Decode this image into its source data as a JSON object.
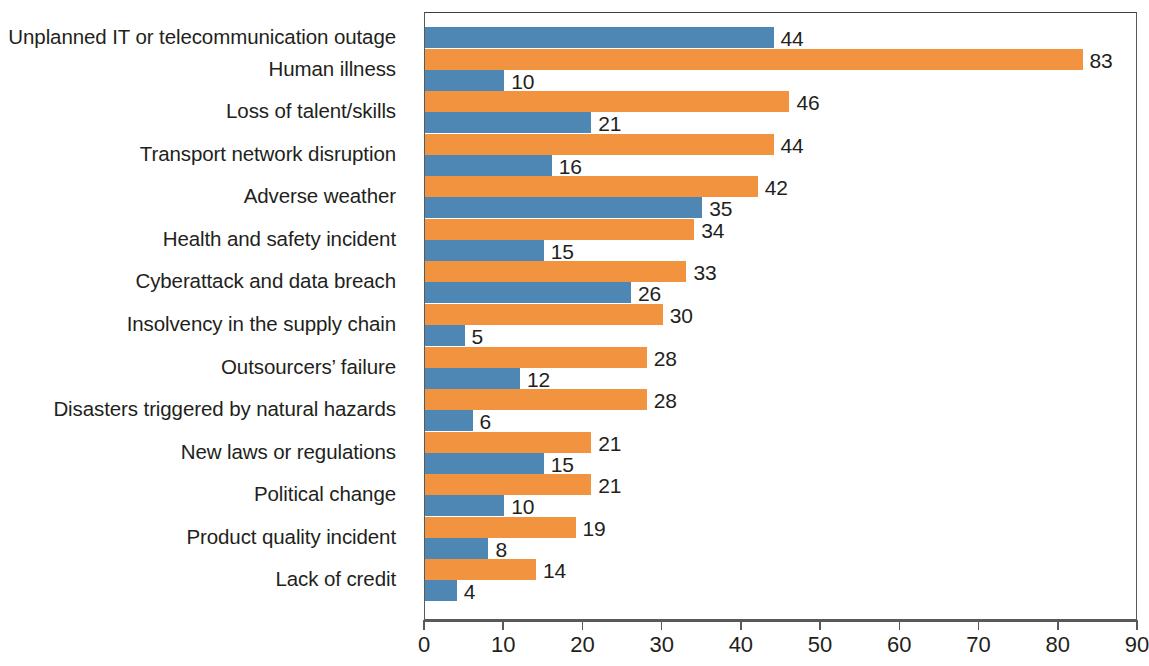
{
  "chart_data": {
    "type": "bar",
    "orientation": "horizontal",
    "title": "",
    "subtitle": "",
    "xlabel": "",
    "ylabel": "",
    "xlim": [
      0,
      90
    ],
    "xticks": [
      0,
      10,
      20,
      30,
      40,
      50,
      60,
      70,
      80,
      90
    ],
    "xtick_labels": [
      "0",
      "10",
      "20",
      "30",
      "40",
      "50",
      "60",
      "70",
      "80",
      "90"
    ],
    "grid": false,
    "legend": null,
    "categories": [
      "Unplanned IT or telecommunication outage",
      "Human illness",
      "Loss of talent/skills",
      "Transport network disruption",
      "Adverse weather",
      "Health and safety incident",
      "Cyberattack and data breach",
      "Insolvency in the supply chain",
      "Outsourcers’ failure",
      "Disasters triggered by natural hazards",
      "New laws or regulations",
      "Political change",
      "Product quality incident",
      "Lack of credit"
    ],
    "series": [
      {
        "name": "orange-series",
        "color": "#f2943f",
        "values": [
          null,
          83,
          46,
          44,
          42,
          34,
          33,
          30,
          28,
          28,
          21,
          21,
          19,
          14
        ],
        "value_labels": [
          "",
          "83",
          "46",
          "44",
          "42",
          "34",
          "33",
          "30",
          "28",
          "28",
          "21",
          "21",
          "19",
          "14"
        ]
      },
      {
        "name": "blue-series",
        "color": "#4e87b4",
        "values": [
          44,
          10,
          21,
          16,
          35,
          15,
          26,
          5,
          12,
          6,
          15,
          10,
          8,
          4
        ],
        "value_labels": [
          "44",
          "10",
          "21",
          "16",
          "35",
          "15",
          "26",
          "5",
          "12",
          "6",
          "15",
          "10",
          "8",
          "4"
        ]
      }
    ],
    "colors": {
      "orange": "#f2943f",
      "blue": "#4e87b4",
      "axis": "#58595b",
      "text": "#231f20",
      "background": "#ffffff"
    }
  }
}
